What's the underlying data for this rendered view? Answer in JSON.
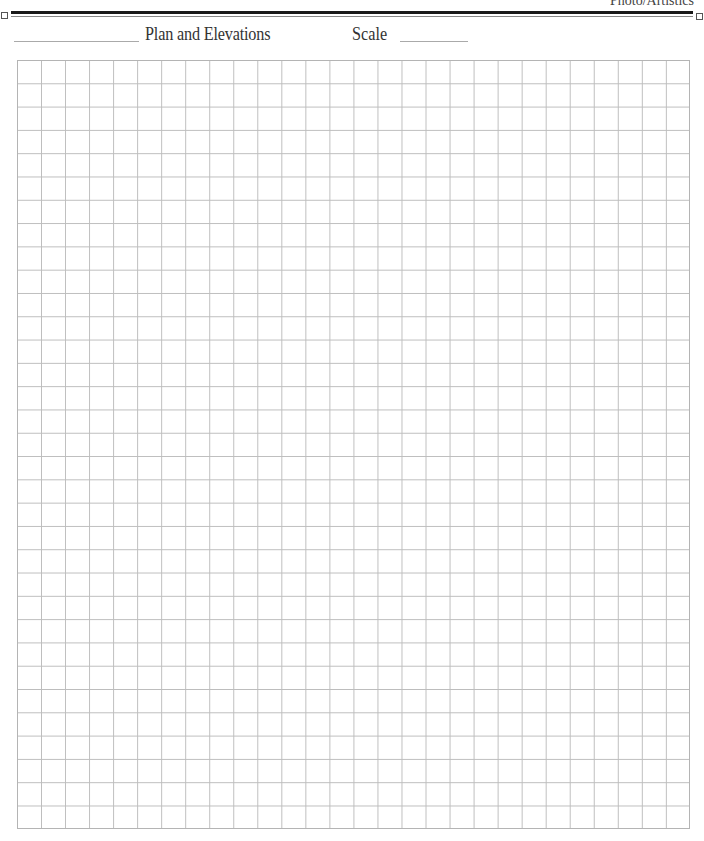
{
  "header": {
    "brand": "Photo/Artistics"
  },
  "form": {
    "title": "Plan and Elevations",
    "scale_label": "Scale",
    "name_blank": "",
    "scale_blank": ""
  },
  "grid": {
    "columns": 28,
    "rows": 33,
    "line_color": "#bdbdbd"
  }
}
